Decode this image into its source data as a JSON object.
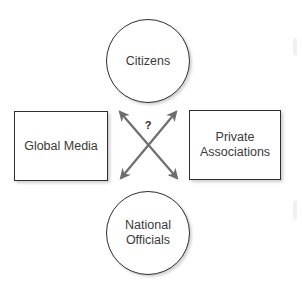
{
  "diagram": {
    "nodes": {
      "top": {
        "label": "Citizens",
        "shape": "circle"
      },
      "bottom": {
        "label": "National\nOfficials",
        "shape": "circle"
      },
      "left": {
        "label": "Global Media",
        "shape": "rectangle"
      },
      "right": {
        "label": "Private\nAssociations",
        "shape": "rectangle"
      }
    },
    "connector": {
      "label": "?",
      "type": "crossed-double-headed-arrows",
      "color": "#6e6e6e"
    },
    "colors": {
      "border": "#2e2e2e",
      "text": "#3a3a3a",
      "background": "#ffffff"
    }
  }
}
